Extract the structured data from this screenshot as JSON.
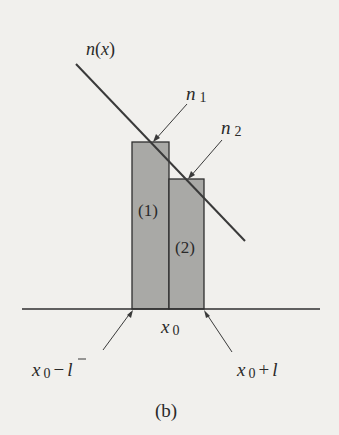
{
  "figure": {
    "caption": "(b)",
    "colors": {
      "background": "#f1f0ed",
      "bar_fill": "#a9a9a6",
      "stroke": "#2f2f2f"
    },
    "curve": {
      "label": "n(x)",
      "label_func": "n",
      "label_arg": "x"
    },
    "bars": [
      {
        "label": "(1)",
        "value_label_base": "n",
        "value_label_sub": "1"
      },
      {
        "label": "(2)",
        "value_label_base": "n",
        "value_label_sub": "2"
      }
    ],
    "axis": {
      "center_label_base": "x",
      "center_label_sub": "0",
      "left_label_base": "x",
      "left_label_sub": "0",
      "left_label_op": "−",
      "left_label_var": "l",
      "right_label_base": "x",
      "right_label_sub": "0",
      "right_label_op": "+",
      "right_label_var": "l"
    }
  }
}
